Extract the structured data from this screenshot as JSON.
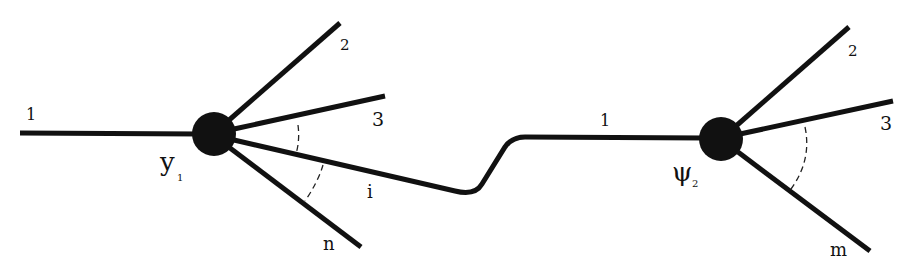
{
  "diagram": {
    "type": "two-vertex diagram connected by a line",
    "colors": {
      "line": "#111111",
      "vertex": "#111111",
      "background": "#ffffff"
    },
    "vertices": [
      {
        "id": "v1",
        "label": "y",
        "subscript": "1",
        "legs": [
          "1",
          "2",
          "3",
          "i",
          "n"
        ]
      },
      {
        "id": "v2",
        "label": "ψ",
        "subscript": "2",
        "legs": [
          "1",
          "2",
          "3",
          "m"
        ]
      }
    ],
    "labels": {
      "v1_leg1": "1",
      "v1_leg2": "2",
      "v1_leg3": "3",
      "v1_legi": "i",
      "v1_legn": "n",
      "v2_leg1": "1",
      "v2_leg2": "2",
      "v2_leg3": "3",
      "v2_legm": "m",
      "v1_name": "y",
      "v1_sub": "1",
      "v2_name": "ψ",
      "v2_sub": "2"
    },
    "edges": [
      {
        "from": "v1",
        "to": "v2",
        "leg_on_v1": "i",
        "leg_on_v2": "1"
      }
    ]
  }
}
